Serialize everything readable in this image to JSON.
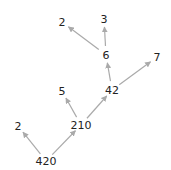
{
  "diagram": {
    "type": "factor-tree",
    "arrow_color": "#aaaaaa",
    "text_color": "#222222",
    "nodes": [
      {
        "id": "n420",
        "label": "420",
        "x": 46,
        "y": 161
      },
      {
        "id": "n2a",
        "label": "2",
        "x": 18,
        "y": 126
      },
      {
        "id": "n210",
        "label": "210",
        "x": 81,
        "y": 125
      },
      {
        "id": "n5",
        "label": "5",
        "x": 62,
        "y": 91
      },
      {
        "id": "n42",
        "label": "42",
        "x": 112,
        "y": 90
      },
      {
        "id": "n6",
        "label": "6",
        "x": 106,
        "y": 55
      },
      {
        "id": "n7",
        "label": "7",
        "x": 157,
        "y": 57
      },
      {
        "id": "n2b",
        "label": "2",
        "x": 62,
        "y": 22
      },
      {
        "id": "n3",
        "label": "3",
        "x": 104,
        "y": 19
      }
    ],
    "edges": [
      {
        "from": "n420",
        "to": "n2a"
      },
      {
        "from": "n420",
        "to": "n210"
      },
      {
        "from": "n210",
        "to": "n5"
      },
      {
        "from": "n210",
        "to": "n42"
      },
      {
        "from": "n42",
        "to": "n6"
      },
      {
        "from": "n42",
        "to": "n7"
      },
      {
        "from": "n6",
        "to": "n2b"
      },
      {
        "from": "n6",
        "to": "n3"
      }
    ]
  }
}
